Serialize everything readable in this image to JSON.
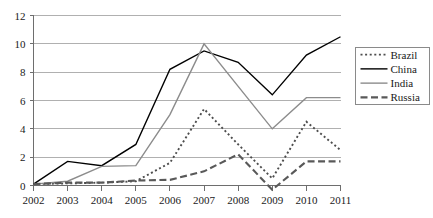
{
  "chart_data": {
    "type": "line",
    "title": "",
    "xlabel": "",
    "ylabel": "",
    "categories": [
      "2002",
      "2003",
      "2004",
      "2005",
      "2006",
      "2007",
      "2008",
      "2009",
      "2010",
      "2011"
    ],
    "x": [
      2002,
      2003,
      2004,
      2005,
      2006,
      2007,
      2008,
      2009,
      2010,
      2011
    ],
    "ylim": [
      0,
      12
    ],
    "yticks": [
      0,
      2,
      4,
      6,
      8,
      10,
      12
    ],
    "ytick_labels": [
      "0",
      "2",
      "4",
      "6",
      "8",
      "10",
      "12"
    ],
    "grid": true,
    "grid_axis": "y",
    "legend_position": "right",
    "series": [
      {
        "name": "Brazil",
        "style": "dotted",
        "color": "#4d4d4d",
        "values": [
          0.1,
          0.15,
          0.2,
          0.3,
          1.6,
          5.4,
          2.9,
          0.5,
          4.5,
          2.5
        ]
      },
      {
        "name": "China",
        "style": "solid",
        "color": "#000000",
        "values": [
          0.1,
          1.7,
          1.4,
          2.9,
          8.2,
          9.5,
          8.7,
          6.4,
          9.2,
          10.5
        ]
      },
      {
        "name": "India",
        "style": "solid",
        "color": "#8c8c8c",
        "values": [
          0.1,
          0.3,
          1.35,
          1.4,
          5.0,
          10.0,
          7.0,
          4.0,
          6.2,
          6.2
        ]
      },
      {
        "name": "Russia",
        "style": "dashed",
        "color": "#595959",
        "values": [
          0.1,
          0.2,
          0.2,
          0.35,
          0.4,
          1.0,
          2.2,
          -0.3,
          1.7,
          1.7
        ]
      }
    ]
  },
  "legend": {
    "entries": [
      {
        "label": "Brazil"
      },
      {
        "label": "China"
      },
      {
        "label": "India"
      },
      {
        "label": "Russia"
      }
    ]
  },
  "axes": {
    "y_tick_labels": [
      "12",
      "10",
      "8",
      "6",
      "4",
      "2",
      "0"
    ],
    "x_tick_labels": [
      "2002",
      "2003",
      "2004",
      "2005",
      "2006",
      "2007",
      "2008",
      "2009",
      "2010",
      "2011"
    ]
  }
}
